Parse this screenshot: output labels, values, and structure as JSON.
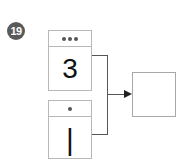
{
  "problem": {
    "number": "19"
  },
  "cards": [
    {
      "dots": 3,
      "value": "3"
    },
    {
      "dots": 1,
      "value": "|"
    }
  ],
  "answer": {
    "value": ""
  }
}
